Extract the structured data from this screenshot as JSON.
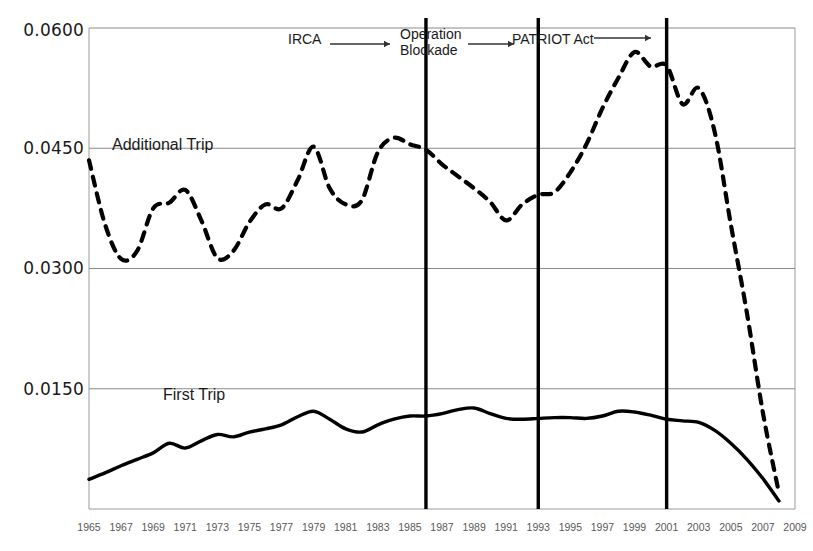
{
  "chart_data": {
    "type": "line",
    "title": "",
    "xlabel": "",
    "ylabel": "",
    "xlim": [
      1965,
      2009
    ],
    "ylim": [
      0.0,
      0.06
    ],
    "grid": true,
    "gridlines_y": [
      0.015,
      0.03,
      0.045,
      0.06
    ],
    "legend_position": "inline-annotation",
    "ytick_labels": [
      "0.0600",
      "0.0450",
      "0.0300",
      "0.0150"
    ],
    "ytick_values": [
      0.06,
      0.045,
      0.03,
      0.015
    ],
    "xtick_labels": [
      "1965",
      "1967",
      "1969",
      "1971",
      "1973",
      "1975",
      "1977",
      "1979",
      "1981",
      "1983",
      "1985",
      "1987",
      "1989",
      "1991",
      "1993",
      "1995",
      "1997",
      "1999",
      "2001",
      "2003",
      "2005",
      "2007",
      "2009"
    ],
    "x": [
      1965,
      1966,
      1967,
      1968,
      1969,
      1970,
      1971,
      1972,
      1973,
      1974,
      1975,
      1976,
      1977,
      1978,
      1979,
      1980,
      1981,
      1982,
      1983,
      1984,
      1985,
      1986,
      1987,
      1988,
      1989,
      1990,
      1991,
      1992,
      1993,
      1994,
      1995,
      1996,
      1997,
      1998,
      1999,
      2000,
      2001,
      2002,
      2003,
      2004,
      2005,
      2006,
      2007,
      2008
    ],
    "series": [
      {
        "name": "Additional Trip",
        "style": "dashed",
        "color": "#000000",
        "values": [
          0.0435,
          0.0355,
          0.0312,
          0.0322,
          0.0375,
          0.0382,
          0.0398,
          0.036,
          0.0313,
          0.0322,
          0.0358,
          0.038,
          0.0375,
          0.041,
          0.0452,
          0.04,
          0.038,
          0.0385,
          0.0445,
          0.0463,
          0.0455,
          0.0448,
          0.043,
          0.0415,
          0.04,
          0.0383,
          0.036,
          0.038,
          0.0392,
          0.0395,
          0.042,
          0.0455,
          0.05,
          0.0538,
          0.057,
          0.0552,
          0.0553,
          0.0505,
          0.0525,
          0.047,
          0.0355,
          0.0245,
          0.012,
          0.002
        ]
      },
      {
        "name": "First Trip",
        "style": "solid",
        "color": "#000000",
        "values": [
          0.0037,
          0.0045,
          0.0054,
          0.0062,
          0.007,
          0.0082,
          0.0076,
          0.0085,
          0.0093,
          0.009,
          0.0096,
          0.01,
          0.0105,
          0.0115,
          0.0122,
          0.0112,
          0.01,
          0.0096,
          0.0105,
          0.0112,
          0.0116,
          0.0116,
          0.0119,
          0.0124,
          0.0126,
          0.0119,
          0.0113,
          0.0112,
          0.0113,
          0.0114,
          0.0114,
          0.0113,
          0.0116,
          0.0122,
          0.0121,
          0.0117,
          0.0112,
          0.011,
          0.0108,
          0.0098,
          0.0082,
          0.0062,
          0.0038,
          0.001
        ]
      }
    ],
    "annotations": [
      {
        "label": "IRCA",
        "x_line": 1986,
        "arrow": true
      },
      {
        "label": "Operation\nBlockade",
        "x_line": 1993,
        "arrow": true
      },
      {
        "label": "PATRIOT Act",
        "x_line": 2001,
        "arrow": true
      }
    ]
  },
  "labels": {
    "additional_trip": "Additional Trip",
    "first_trip": "First Trip",
    "annot_irca": "IRCA",
    "annot_operation_blockade": "Operation\nBlockade",
    "annot_patriot_act": "PATRIOT Act"
  },
  "colors": {
    "line": "#000000",
    "grid": "#8a8a8a",
    "tick_text": "#58585a",
    "axis_text": "#1a1a1a",
    "background": "#ffffff"
  }
}
